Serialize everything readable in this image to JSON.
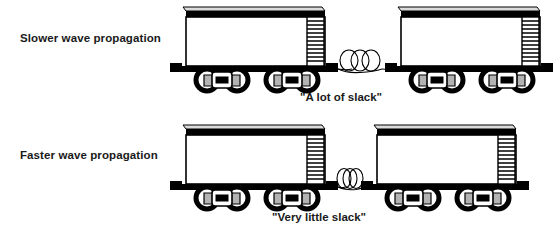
{
  "figure": {
    "title_present": false,
    "background_color": "#ffffff",
    "ink_color": "#000000",
    "metal_gray": "#b3b3b3",
    "roof_gray": "#d9d9d9",
    "rows": [
      {
        "id": "slower",
        "label": "Slower wave propagation",
        "slack_caption": "\"A lot of slack\"",
        "slack_amount": "a lot",
        "coil_loops": 3,
        "coil_spacing_px": 11,
        "gap_px": 74,
        "cars": 2
      },
      {
        "id": "faster",
        "label": "Faster wave propagation",
        "slack_caption": "\"Very little slack\"",
        "slack_amount": "very little",
        "coil_loops": 3,
        "coil_spacing_px": 6,
        "gap_px": 44,
        "cars": 2
      }
    ],
    "car": {
      "wheels_per_car": 4,
      "trucks_per_car": 2,
      "ladder_rungs": 11,
      "body_fill": "#ffffff",
      "roof_band_fill": "#000000",
      "underframe_fill": "#000000"
    }
  },
  "labels": {
    "slower_wave_propagation": "Slower wave propagation",
    "faster_wave_propagation": "Faster wave propagation",
    "a_lot_of_slack": "\"A lot of slack\"",
    "very_little_slack": "\"Very little slack\""
  }
}
